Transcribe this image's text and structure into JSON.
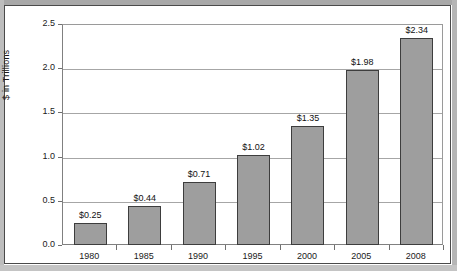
{
  "chart_data": {
    "type": "bar",
    "title": "",
    "xlabel": "",
    "ylabel": "$ in Trillions",
    "categories": [
      "1980",
      "1985",
      "1990",
      "1995",
      "2000",
      "2005",
      "2008"
    ],
    "values": [
      0.25,
      0.44,
      0.71,
      1.02,
      1.35,
      1.98,
      2.34
    ],
    "data_labels": [
      "$0.25",
      "$0.44",
      "$0.71",
      "$1.02",
      "$1.35",
      "$1.98",
      "$2.34"
    ],
    "ylim": [
      0.0,
      2.5
    ],
    "ytick_labels": [
      "0.0",
      "0.5",
      "1.0",
      "1.5",
      "2.0",
      "2.5"
    ],
    "ytick_values": [
      0.0,
      0.5,
      1.0,
      1.5,
      2.0,
      2.5
    ],
    "grid": true,
    "legend": "none",
    "series": [
      {
        "name": "",
        "values": [
          0.25,
          0.44,
          0.71,
          1.02,
          1.35,
          1.98,
          2.34
        ]
      }
    ],
    "colors": {
      "bar_fill": "#9e9e9e",
      "bar_stroke": "#3d3d3d",
      "gridline": "#a6a6a6",
      "axis": "#808080",
      "text": "#1a1a1a",
      "plot_background": "#ffffff",
      "frame": "#4a4a4a"
    }
  }
}
